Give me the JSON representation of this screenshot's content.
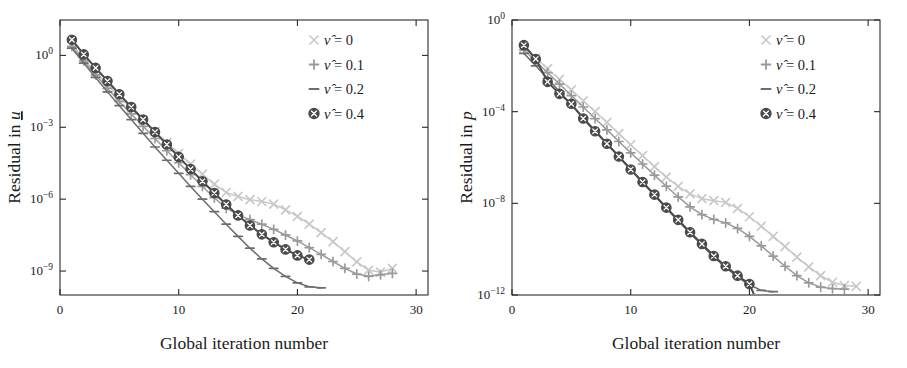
{
  "figure": {
    "background": "#ffffff",
    "panels": [
      "u",
      "p"
    ]
  },
  "colors": {
    "nu0": "#c9c9c9",
    "nu01": "#9a9a9a",
    "nu02": "#6d6d6d",
    "nu04": "#4a4a4a",
    "axis": "#2a2a2a",
    "text": "#1b1b1b"
  },
  "legend": {
    "entries": [
      {
        "marker": "cross-icon",
        "label": "ν̂ = 0",
        "color_key": "nu0"
      },
      {
        "marker": "plus-icon",
        "label": "ν̂ = 0.1",
        "color_key": "nu01"
      },
      {
        "marker": "dash-icon",
        "label": "ν̂ = 0.2",
        "color_key": "nu02"
      },
      {
        "marker": "circled-cross-icon",
        "label": "ν̂ = 0.4",
        "color_key": "nu04"
      }
    ]
  },
  "chart_data": [
    {
      "type": "line",
      "panel_id": "residual-u",
      "title": "",
      "xlabel": "Global iteration number",
      "ylabel": "Residual in u",
      "yscale": "log",
      "xscale": "linear",
      "xlim": [
        0,
        31
      ],
      "ylim": [
        1e-10,
        30
      ],
      "xticks": [
        0,
        10,
        20,
        30
      ],
      "xticklabels": [
        "0",
        "10",
        "20",
        "30"
      ],
      "yticks": [
        1,
        0.001,
        1e-06,
        1e-09
      ],
      "yticklabels": [
        "10⁰",
        "10⁻³",
        "10⁻⁶",
        "10⁻⁹"
      ],
      "grid": false,
      "legend_position": "top-right",
      "series": [
        {
          "name": "ν̂ = 0",
          "color_key": "nu0",
          "marker": "cross-icon",
          "x": [
            1,
            2,
            3,
            4,
            5,
            6,
            7,
            8,
            9,
            10,
            11,
            12,
            13,
            14,
            15,
            16,
            17,
            18,
            19,
            20,
            21,
            22,
            23,
            24,
            25,
            26,
            27,
            28
          ],
          "y": [
            2.8,
            0.72,
            0.2,
            0.06,
            0.019,
            0.0061,
            0.002,
            0.00068,
            0.00023,
            8.2e-05,
            2.9e-05,
            1.1e-05,
            4.2e-06,
            1.9e-06,
            1.3e-06,
            9.5e-07,
            8e-07,
            6.2e-07,
            3.6e-07,
            1.9e-07,
            9e-08,
            4e-08,
            1.7e-08,
            6.5e-09,
            2.4e-09,
            1.1e-09,
            9e-10,
            1.3e-09
          ]
        },
        {
          "name": "ν̂ = 0.1",
          "color_key": "nu01",
          "marker": "plus-icon",
          "x": [
            1,
            2,
            3,
            4,
            5,
            6,
            7,
            8,
            9,
            10,
            11,
            12,
            13,
            14,
            15,
            16,
            17,
            18,
            19,
            20,
            21,
            22,
            23,
            24,
            25,
            26,
            27,
            28
          ],
          "y": [
            2.4,
            0.6,
            0.155,
            0.042,
            0.012,
            0.0036,
            0.0011,
            0.00034,
            0.000105,
            3.3e-05,
            1.05e-05,
            3.4e-06,
            1.15e-06,
            4.2e-07,
            2.2e-07,
            1.4e-07,
            9e-08,
            5.5e-08,
            3.2e-08,
            1.8e-08,
            9.5e-09,
            5e-09,
            2.5e-09,
            1.3e-09,
            7.5e-10,
            6e-10,
            7e-10,
            8e-10
          ]
        },
        {
          "name": "ν̂ = 0.2",
          "color_key": "nu02",
          "marker": "dash-icon",
          "x": [
            1,
            2,
            3,
            4,
            5,
            6,
            7,
            8,
            9,
            10,
            11,
            12,
            13,
            14,
            15,
            16,
            17,
            18,
            19,
            20,
            21,
            22
          ],
          "y": [
            2.0,
            0.48,
            0.12,
            0.03,
            0.008,
            0.0021,
            0.00056,
            0.00015,
            4.2e-05,
            1.2e-05,
            3.4e-06,
            1e-06,
            3e-07,
            9e-08,
            2.8e-08,
            9e-09,
            3.2e-09,
            1.3e-09,
            6e-10,
            3.2e-10,
            2.2e-10,
            2e-10
          ]
        },
        {
          "name": "ν̂ = 0.4",
          "color_key": "nu04",
          "marker": "circled-cross-icon",
          "x": [
            1,
            2,
            3,
            4,
            5,
            6,
            7,
            8,
            9,
            10,
            11,
            12,
            13,
            14,
            15,
            16,
            17,
            18,
            19,
            20,
            21
          ],
          "y": [
            4.5,
            1.1,
            0.3,
            0.085,
            0.024,
            0.007,
            0.0021,
            0.00063,
            0.00019,
            5.8e-05,
            1.8e-05,
            5.6e-06,
            1.8e-06,
            6e-07,
            2.1e-07,
            8e-08,
            3.4e-08,
            1.6e-08,
            8e-09,
            4.5e-09,
            3e-09
          ]
        }
      ]
    },
    {
      "type": "line",
      "panel_id": "residual-p",
      "title": "",
      "xlabel": "Global iteration number",
      "ylabel": "Residual in p",
      "yscale": "log",
      "xscale": "linear",
      "xlim": [
        0,
        31
      ],
      "ylim": [
        1e-12,
        1
      ],
      "xticks": [
        0,
        10,
        20,
        30
      ],
      "xticklabels": [
        "0",
        "10",
        "20",
        "30"
      ],
      "yticks": [
        1,
        0.0001,
        1e-08,
        1e-12
      ],
      "yticklabels": [
        "10⁰",
        "10⁻⁴",
        "10⁻⁸",
        "10⁻¹²"
      ],
      "grid": false,
      "legend_position": "top-right",
      "series": [
        {
          "name": "ν̂ = 0",
          "color_key": "nu0",
          "marker": "cross-icon",
          "x": [
            1,
            2,
            3,
            4,
            5,
            6,
            7,
            8,
            9,
            10,
            11,
            12,
            13,
            14,
            15,
            16,
            17,
            18,
            19,
            20,
            21,
            22,
            23,
            24,
            25,
            26,
            27,
            28,
            29
          ],
          "y": [
            0.06,
            0.022,
            0.0075,
            0.0026,
            0.0009,
            0.0003,
            0.0001,
            3.4e-05,
            1.1e-05,
            3.6e-06,
            1.2e-06,
            4e-07,
            1.4e-07,
            5.5e-08,
            2.6e-08,
            1.6e-08,
            1.3e-08,
            1.1e-08,
            6e-09,
            2.6e-09,
            1e-09,
            3.6e-10,
            1.3e-10,
            4.5e-11,
            1.7e-11,
            7e-12,
            3.6e-12,
            2.6e-12,
            2.4e-12
          ]
        },
        {
          "name": "ν̂ = 0.1",
          "color_key": "nu01",
          "marker": "plus-icon",
          "x": [
            1,
            2,
            3,
            4,
            5,
            6,
            7,
            8,
            9,
            10,
            11,
            12,
            13,
            14,
            15,
            16,
            17,
            18,
            19,
            20,
            21,
            22,
            23,
            24,
            25,
            26,
            27,
            28
          ],
          "y": [
            0.05,
            0.016,
            0.005,
            0.0016,
            0.0005,
            0.00016,
            5e-05,
            1.6e-05,
            5e-06,
            1.6e-06,
            5.2e-07,
            1.7e-07,
            5.6e-08,
            1.9e-08,
            7e-09,
            3.2e-09,
            2e-09,
            1.4e-09,
            8e-10,
            3.6e-10,
            1.4e-10,
            5e-11,
            1.8e-11,
            7e-12,
            3.4e-12,
            2.2e-12,
            1.9e-12,
            1.8e-12
          ]
        },
        {
          "name": "ν̂ = 0.2",
          "color_key": "nu02",
          "marker": "dash-icon",
          "x": [
            1,
            2,
            3,
            4,
            5,
            6,
            7,
            8,
            9,
            10,
            11,
            12,
            13,
            14,
            15,
            16,
            17,
            18,
            19,
            20,
            21,
            22
          ],
          "y": [
            0.035,
            0.01,
            0.0028,
            0.00075,
            0.0002,
            5.5e-05,
            1.5e-05,
            4e-06,
            1.1e-06,
            3e-07,
            8e-08,
            2.2e-08,
            6e-09,
            1.7e-09,
            5e-10,
            1.5e-10,
            4.5e-11,
            1.6e-11,
            6e-12,
            2.8e-12,
            1.6e-12,
            1.4e-12
          ]
        },
        {
          "name": "ν̂ = 0.4",
          "color_key": "nu04",
          "marker": "circled-cross-icon",
          "x": [
            1,
            2,
            3,
            4,
            5,
            6,
            7,
            8,
            9,
            10,
            11,
            12,
            13,
            14,
            15,
            16,
            17,
            18,
            19,
            20,
            21
          ],
          "y": [
            0.08,
            0.02,
            0.002,
            0.0006,
            0.00022,
            5e-05,
            1.4e-05,
            4e-06,
            1.1e-06,
            3e-07,
            8.5e-08,
            2.4e-08,
            6.5e-09,
            1.9e-09,
            5.5e-10,
            1.7e-10,
            5e-11,
            1.8e-11,
            7e-12,
            3e-12,
            2e-13
          ]
        }
      ]
    }
  ]
}
